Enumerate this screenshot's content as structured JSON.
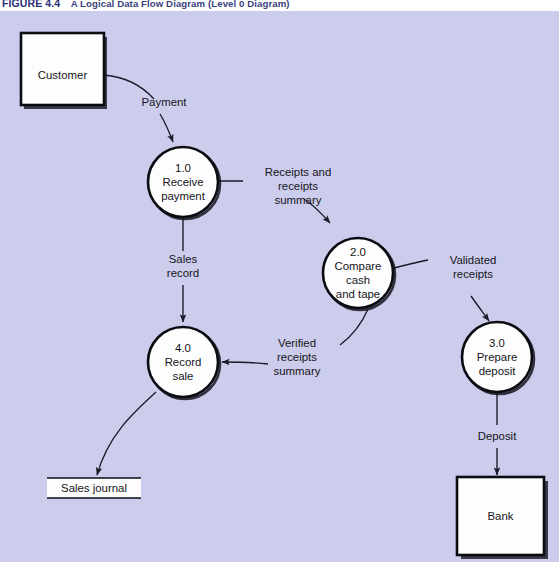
{
  "figure": {
    "number": "FIGURE 4.4",
    "title": "A Logical Data Flow Diagram (Level 0 Diagram)"
  },
  "colors": {
    "canvas_background": "#ccccec",
    "caption_band": "#ffffff",
    "caption_number": "#2b2f77",
    "caption_title": "#3a3f80",
    "shape_fill": "#fdfdfd",
    "shape_stroke": "#0b0b12",
    "flow_stroke": "#1a1a28"
  },
  "diagram": {
    "type": "data-flow-diagram",
    "level": "Level 0",
    "external_entities": [
      {
        "id": "customer",
        "label": "Customer"
      },
      {
        "id": "bank",
        "label": "Bank"
      }
    ],
    "processes": [
      {
        "id": "p1",
        "number": "1.0",
        "line1": "Receive",
        "line2": "payment",
        "line3": "",
        "name": "Receive payment"
      },
      {
        "id": "p2",
        "number": "2.0",
        "line1": "Compare",
        "line2": "cash",
        "line3": "and tape",
        "name": "Compare cash and tape"
      },
      {
        "id": "p3",
        "number": "3.0",
        "line1": "Prepare",
        "line2": "deposit",
        "line3": "",
        "name": "Prepare deposit"
      },
      {
        "id": "p4",
        "number": "4.0",
        "line1": "Record",
        "line2": "sale",
        "line3": "",
        "name": "Record sale"
      }
    ],
    "data_stores": [
      {
        "id": "sales-journal",
        "label": "Sales journal"
      }
    ],
    "data_flows": [
      {
        "id": "f1",
        "label": "Payment",
        "from": "Customer",
        "to": "1.0 Receive payment",
        "lines": [
          "Payment"
        ]
      },
      {
        "id": "f2",
        "label": "Receipts and receipts summary",
        "from": "1.0 Receive payment",
        "to": "2.0 Compare cash and tape",
        "lines": [
          "Receipts and",
          "receipts",
          "summary"
        ]
      },
      {
        "id": "f3",
        "label": "Sales record",
        "from": "1.0 Receive payment",
        "to": "4.0 Record sale",
        "lines": [
          "Sales",
          "record"
        ]
      },
      {
        "id": "f4",
        "label": "Validated receipts",
        "from": "2.0 Compare cash and tape",
        "to": "3.0 Prepare deposit",
        "lines": [
          "Validated",
          "receipts"
        ]
      },
      {
        "id": "f5",
        "label": "Verified receipts summary",
        "from": "2.0 Compare cash and tape",
        "to": "4.0 Record sale",
        "lines": [
          "Verified",
          "receipts",
          "summary"
        ]
      },
      {
        "id": "f6",
        "label": "Deposit",
        "from": "3.0 Prepare deposit",
        "to": "Bank",
        "lines": [
          "Deposit"
        ]
      },
      {
        "id": "f7",
        "label": "",
        "from": "4.0 Record sale",
        "to": "Sales journal",
        "lines": []
      }
    ]
  }
}
